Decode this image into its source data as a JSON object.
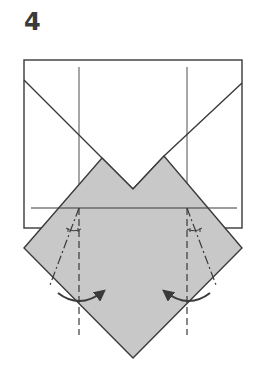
{
  "step": {
    "number": "4"
  },
  "colors": {
    "line": "#3a3a3a",
    "paper_back": "#ffffff",
    "paper_colored": "#c8c8c8"
  },
  "diagram": {
    "rectangle": {
      "left": 24,
      "top": 60,
      "right": 242,
      "bottom": 228
    },
    "top_flaps_left_diag": [
      [
        24,
        80
      ],
      [
        102,
        158
      ],
      [
        133,
        189
      ]
    ],
    "top_flaps_right_diag": [
      [
        242,
        83
      ],
      [
        164,
        156
      ],
      [
        133,
        189
      ]
    ],
    "diamond": [
      [
        24,
        248
      ],
      [
        102,
        158
      ],
      [
        133,
        189
      ],
      [
        164,
        156
      ],
      [
        242,
        248
      ],
      [
        133,
        358
      ]
    ],
    "crease_vertical_left": {
      "x": 79,
      "y1": 67,
      "y2": 208
    },
    "crease_vertical_right": {
      "x": 187,
      "y1": 67,
      "y2": 208
    },
    "horizontal_line": {
      "y": 208,
      "x1": 31,
      "x2": 237
    },
    "mountain_fold_left": {
      "from": [
        79,
        208
      ],
      "to": [
        50,
        285
      ]
    },
    "mountain_fold_right": {
      "from": [
        187,
        208
      ],
      "to": [
        216,
        285
      ]
    },
    "valley_fold_left": {
      "from": [
        79,
        208
      ],
      "to": [
        79,
        335
      ]
    },
    "valley_fold_right": {
      "from": [
        187,
        208
      ],
      "to": [
        187,
        335
      ]
    },
    "arrow_left": {
      "d": "M58 293 Q80 310 104 291"
    },
    "arrow_right": {
      "d": "M210 293 Q188 310 164 291"
    }
  }
}
